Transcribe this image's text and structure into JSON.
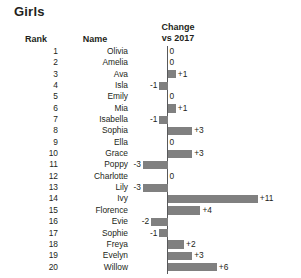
{
  "title": "Girls",
  "headers": {
    "rank": "Rank",
    "name": "Name",
    "change_line1": "Change",
    "change_line2": "vs 2017"
  },
  "style": {
    "bar_color": "#808080",
    "axis_color": "#58595b",
    "text_color": "#231f20",
    "background": "#ffffff"
  },
  "chart_data": {
    "type": "bar",
    "orientation": "horizontal",
    "title": "Girls",
    "xlabel": "Change vs 2017",
    "ylabel": "Rank",
    "grid": false,
    "legend": null,
    "zero_baseline": true,
    "px_per_unit": 8.2,
    "xlim": [
      -3,
      11
    ],
    "categories": [
      "Olivia",
      "Amelia",
      "Ava",
      "Isla",
      "Emily",
      "Mia",
      "Isabella",
      "Sophia",
      "Ella",
      "Grace",
      "Poppy",
      "Charlotte",
      "Lily",
      "Ivy",
      "Florence",
      "Evie",
      "Sophie",
      "Freya",
      "Evelyn",
      "Willow"
    ],
    "values": [
      0,
      0,
      1,
      -1,
      0,
      1,
      -1,
      3,
      0,
      3,
      -3,
      0,
      -3,
      11,
      4,
      -2,
      -1,
      2,
      3,
      6
    ],
    "labels": [
      "0",
      "0",
      "+1",
      "-1",
      "0",
      "+1",
      "-1",
      "+3",
      "0",
      "+3",
      "-3",
      "0",
      "-3",
      "+11",
      "+4",
      "-2",
      "-1",
      "+2",
      "+3",
      "+6"
    ]
  },
  "rows": [
    {
      "rank": "1",
      "name": "Olivia",
      "value": 0,
      "label": "0"
    },
    {
      "rank": "2",
      "name": "Amelia",
      "value": 0,
      "label": "0"
    },
    {
      "rank": "3",
      "name": "Ava",
      "value": 1,
      "label": "+1"
    },
    {
      "rank": "4",
      "name": "Isla",
      "value": -1,
      "label": "-1"
    },
    {
      "rank": "5",
      "name": "Emily",
      "value": 0,
      "label": "0"
    },
    {
      "rank": "6",
      "name": "Mia",
      "value": 1,
      "label": "+1"
    },
    {
      "rank": "7",
      "name": "Isabella",
      "value": -1,
      "label": "-1"
    },
    {
      "rank": "8",
      "name": "Sophia",
      "value": 3,
      "label": "+3"
    },
    {
      "rank": "9",
      "name": "Ella",
      "value": 0,
      "label": "0"
    },
    {
      "rank": "10",
      "name": "Grace",
      "value": 3,
      "label": "+3"
    },
    {
      "rank": "11",
      "name": "Poppy",
      "value": -3,
      "label": "-3"
    },
    {
      "rank": "12",
      "name": "Charlotte",
      "value": 0,
      "label": "0"
    },
    {
      "rank": "13",
      "name": "Lily",
      "value": -3,
      "label": "-3"
    },
    {
      "rank": "14",
      "name": "Ivy",
      "value": 11,
      "label": "+11"
    },
    {
      "rank": "15",
      "name": "Florence",
      "value": 4,
      "label": "+4"
    },
    {
      "rank": "16",
      "name": "Evie",
      "value": -2,
      "label": "-2"
    },
    {
      "rank": "17",
      "name": "Sophie",
      "value": -1,
      "label": "-1"
    },
    {
      "rank": "18",
      "name": "Freya",
      "value": 2,
      "label": "+2"
    },
    {
      "rank": "19",
      "name": "Evelyn",
      "value": 3,
      "label": "+3"
    },
    {
      "rank": "20",
      "name": "Willow",
      "value": 6,
      "label": "+6"
    }
  ]
}
